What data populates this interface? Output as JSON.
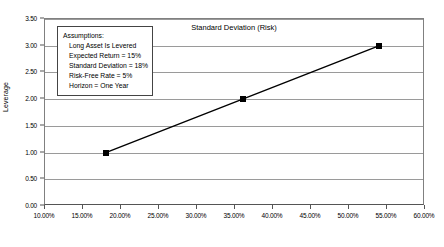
{
  "chart_data": {
    "type": "line",
    "title": "",
    "xlabel": "Standard Deviation (Risk)",
    "ylabel": "Leverage",
    "xlim": [
      0.1,
      0.6
    ],
    "ylim": [
      0.0,
      3.5
    ],
    "grid": "horizontal",
    "legend": "none",
    "x_tick_labels": [
      "10.00%",
      "15.00%",
      "20.00%",
      "25.00%",
      "30.00%",
      "35.00%",
      "40.00%",
      "45.00%",
      "50.00%",
      "55.00%",
      "60.00%"
    ],
    "x_tick_values": [
      0.1,
      0.15,
      0.2,
      0.25,
      0.3,
      0.35,
      0.4,
      0.45,
      0.5,
      0.55,
      0.6
    ],
    "y_tick_labels": [
      "0.00",
      "0.50",
      "1.00",
      "1.50",
      "2.00",
      "2.50",
      "3.00",
      "3.50"
    ],
    "y_tick_values": [
      0.0,
      0.5,
      1.0,
      1.5,
      2.0,
      2.5,
      3.0,
      3.5
    ],
    "series": [
      {
        "name": "Leverage vs Standard Deviation",
        "color": "#000000",
        "marker": "square",
        "x": [
          0.18,
          0.36,
          0.54
        ],
        "values": [
          1.0,
          2.0,
          3.0
        ]
      }
    ]
  },
  "annotation": {
    "title": "Assumptions:",
    "lines": [
      "Long Asset Is Levered",
      "Expected Return = 15%",
      "Standard Deviation = 18%",
      "Risk-Free Rate = 5%",
      "Horizon = One Year"
    ]
  }
}
